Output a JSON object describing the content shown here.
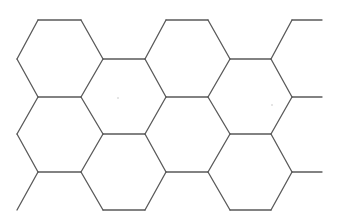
{
  "diagram": {
    "type": "hexagonal-grid",
    "colors": {
      "background": "#ffffff",
      "stroke": "#5a5a5a"
    },
    "stroke_width": 1.3,
    "hexagons": [
      {
        "id": "A",
        "points": [
          [
            38,
            20
          ],
          [
            81,
            20
          ],
          [
            103,
            59
          ],
          [
            81,
            97
          ],
          [
            38,
            97
          ],
          [
            17,
            59
          ]
        ]
      },
      {
        "id": "B",
        "points": [
          [
            103,
            59
          ],
          [
            145,
            59
          ],
          [
            166,
            97
          ],
          [
            145,
            134
          ],
          [
            103,
            134
          ],
          [
            81,
            97
          ]
        ]
      },
      {
        "id": "C",
        "points": [
          [
            166,
            20
          ],
          [
            208,
            20
          ],
          [
            230,
            59
          ],
          [
            208,
            97
          ],
          [
            166,
            97
          ],
          [
            145,
            59
          ]
        ]
      },
      {
        "id": "D",
        "points": [
          [
            230,
            59
          ],
          [
            271,
            59
          ],
          [
            292,
            97
          ],
          [
            271,
            134
          ],
          [
            230,
            134
          ],
          [
            208,
            97
          ]
        ]
      },
      {
        "id": "F",
        "points": [
          [
            38,
            97
          ],
          [
            81,
            97
          ],
          [
            103,
            134
          ],
          [
            81,
            172
          ],
          [
            38,
            172
          ],
          [
            17,
            134
          ]
        ]
      },
      {
        "id": "G",
        "points": [
          [
            166,
            97
          ],
          [
            208,
            97
          ],
          [
            230,
            134
          ],
          [
            208,
            172
          ],
          [
            166,
            172
          ],
          [
            145,
            134
          ]
        ]
      },
      {
        "id": "I",
        "points": [
          [
            103,
            134
          ],
          [
            145,
            134
          ],
          [
            166,
            172
          ],
          [
            145,
            210
          ],
          [
            103,
            210
          ],
          [
            81,
            172
          ]
        ]
      },
      {
        "id": "J",
        "points": [
          [
            230,
            134
          ],
          [
            271,
            134
          ],
          [
            292,
            172
          ],
          [
            271,
            210
          ],
          [
            230,
            210
          ],
          [
            208,
            172
          ]
        ]
      }
    ],
    "open_segments": [
      [
        [
          271,
          59
        ],
        [
          292,
          20
        ]
      ],
      [
        [
          292,
          20
        ],
        [
          322,
          20
        ]
      ],
      [
        [
          292,
          97
        ],
        [
          322,
          97
        ]
      ],
      [
        [
          271,
          134
        ],
        [
          292,
          97
        ]
      ],
      [
        [
          292,
          172
        ],
        [
          322,
          172
        ]
      ],
      [
        [
          38,
          172
        ],
        [
          17,
          210
        ]
      ]
    ],
    "specks": [
      [
        118,
        98
      ],
      [
        272,
        105
      ]
    ]
  }
}
